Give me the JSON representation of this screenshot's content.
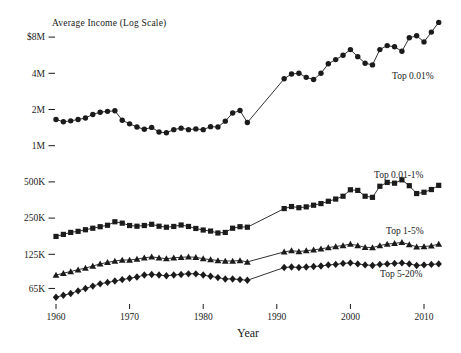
{
  "chart_data": {
    "type": "line",
    "title": "Average Income (Log Scale)",
    "xlabel": "Year",
    "scale": "log",
    "grid": false,
    "background": "#ffffff",
    "line_color": "#1b1b1b",
    "x_range": [
      1960,
      2012
    ],
    "x_ticks": [
      1960,
      1970,
      1980,
      1990,
      2000,
      2010
    ],
    "y_ticks": [
      {
        "label": "$8M",
        "value": 8000000
      },
      {
        "label": "4M",
        "value": 4000000
      },
      {
        "label": "2M",
        "value": 2000000
      },
      {
        "label": "1M",
        "value": 1000000
      },
      {
        "label": "500K",
        "value": 500000
      },
      {
        "label": "250K",
        "value": 250000
      },
      {
        "label": "125K",
        "value": 125000
      },
      {
        "label": "65K",
        "value": 65000
      }
    ],
    "data_gap_years": [
      1987,
      1988,
      1989,
      1990
    ],
    "series": [
      {
        "name": "Top 0.01%",
        "marker": "circle",
        "label_pos": {
          "x": 392,
          "y": 79
        },
        "points": [
          [
            1960,
            1650000
          ],
          [
            1961,
            1580000
          ],
          [
            1962,
            1610000
          ],
          [
            1963,
            1650000
          ],
          [
            1964,
            1700000
          ],
          [
            1965,
            1820000
          ],
          [
            1966,
            1900000
          ],
          [
            1967,
            1930000
          ],
          [
            1968,
            1950000
          ],
          [
            1969,
            1630000
          ],
          [
            1970,
            1520000
          ],
          [
            1971,
            1430000
          ],
          [
            1972,
            1370000
          ],
          [
            1973,
            1420000
          ],
          [
            1974,
            1300000
          ],
          [
            1975,
            1280000
          ],
          [
            1976,
            1360000
          ],
          [
            1977,
            1400000
          ],
          [
            1978,
            1360000
          ],
          [
            1979,
            1380000
          ],
          [
            1980,
            1360000
          ],
          [
            1981,
            1440000
          ],
          [
            1982,
            1430000
          ],
          [
            1983,
            1600000
          ],
          [
            1984,
            1870000
          ],
          [
            1985,
            1960000
          ],
          [
            1986,
            1560000
          ],
          [
            1991,
            3600000
          ],
          [
            1992,
            3950000
          ],
          [
            1993,
            4000000
          ],
          [
            1994,
            3700000
          ],
          [
            1995,
            3550000
          ],
          [
            1996,
            4000000
          ],
          [
            1997,
            4800000
          ],
          [
            1998,
            5200000
          ],
          [
            1999,
            5650000
          ],
          [
            2000,
            6300000
          ],
          [
            2001,
            5500000
          ],
          [
            2002,
            4850000
          ],
          [
            2003,
            4700000
          ],
          [
            2004,
            6300000
          ],
          [
            2005,
            6800000
          ],
          [
            2006,
            6650000
          ],
          [
            2007,
            6100000
          ],
          [
            2008,
            7900000
          ],
          [
            2009,
            8200000
          ],
          [
            2010,
            7300000
          ],
          [
            2011,
            8800000
          ],
          [
            2012,
            10600000
          ]
        ]
      },
      {
        "name": "Top 0.01-1%",
        "marker": "square",
        "label_pos": {
          "x": 374,
          "y": 178
        },
        "points": [
          [
            1960,
            176000
          ],
          [
            1961,
            183000
          ],
          [
            1962,
            190000
          ],
          [
            1963,
            194000
          ],
          [
            1964,
            200000
          ],
          [
            1965,
            206000
          ],
          [
            1966,
            212000
          ],
          [
            1967,
            218000
          ],
          [
            1968,
            233000
          ],
          [
            1969,
            227000
          ],
          [
            1970,
            217000
          ],
          [
            1971,
            214000
          ],
          [
            1972,
            217000
          ],
          [
            1973,
            222000
          ],
          [
            1974,
            214000
          ],
          [
            1975,
            210000
          ],
          [
            1976,
            213000
          ],
          [
            1977,
            219000
          ],
          [
            1978,
            213000
          ],
          [
            1979,
            205000
          ],
          [
            1980,
            199000
          ],
          [
            1981,
            195000
          ],
          [
            1982,
            188000
          ],
          [
            1983,
            190000
          ],
          [
            1984,
            206000
          ],
          [
            1985,
            212000
          ],
          [
            1986,
            210000
          ],
          [
            1991,
            300000
          ],
          [
            1992,
            312000
          ],
          [
            1993,
            305000
          ],
          [
            1994,
            310000
          ],
          [
            1995,
            320000
          ],
          [
            1996,
            330000
          ],
          [
            1997,
            345000
          ],
          [
            1998,
            360000
          ],
          [
            1999,
            380000
          ],
          [
            2000,
            430000
          ],
          [
            2001,
            425000
          ],
          [
            2002,
            380000
          ],
          [
            2003,
            372000
          ],
          [
            2004,
            460000
          ],
          [
            2005,
            495000
          ],
          [
            2006,
            488000
          ],
          [
            2007,
            520000
          ],
          [
            2008,
            465000
          ],
          [
            2009,
            400000
          ],
          [
            2010,
            410000
          ],
          [
            2011,
            432000
          ],
          [
            2012,
            468000
          ]
        ]
      },
      {
        "name": "Top 1-5%",
        "marker": "triangle",
        "label_pos": {
          "x": 386,
          "y": 234
        },
        "points": [
          [
            1960,
            84000
          ],
          [
            1961,
            87000
          ],
          [
            1962,
            90000
          ],
          [
            1963,
            93000
          ],
          [
            1964,
            96000
          ],
          [
            1965,
            100000
          ],
          [
            1966,
            104000
          ],
          [
            1967,
            107000
          ],
          [
            1968,
            110000
          ],
          [
            1969,
            112000
          ],
          [
            1970,
            112000
          ],
          [
            1971,
            114000
          ],
          [
            1972,
            117000
          ],
          [
            1973,
            119000
          ],
          [
            1974,
            117000
          ],
          [
            1975,
            115000
          ],
          [
            1976,
            117000
          ],
          [
            1977,
            118000
          ],
          [
            1978,
            119000
          ],
          [
            1979,
            118000
          ],
          [
            1980,
            115000
          ],
          [
            1981,
            113000
          ],
          [
            1982,
            111000
          ],
          [
            1983,
            110000
          ],
          [
            1984,
            110000
          ],
          [
            1985,
            111000
          ],
          [
            1986,
            108000
          ],
          [
            1991,
            131000
          ],
          [
            1992,
            134000
          ],
          [
            1993,
            132000
          ],
          [
            1994,
            134000
          ],
          [
            1995,
            136000
          ],
          [
            1996,
            139000
          ],
          [
            1997,
            142000
          ],
          [
            1998,
            145000
          ],
          [
            1999,
            148000
          ],
          [
            2000,
            152000
          ],
          [
            2001,
            148000
          ],
          [
            2002,
            143000
          ],
          [
            2003,
            142000
          ],
          [
            2004,
            148000
          ],
          [
            2005,
            152000
          ],
          [
            2006,
            154000
          ],
          [
            2007,
            157000
          ],
          [
            2008,
            151000
          ],
          [
            2009,
            144000
          ],
          [
            2010,
            145000
          ],
          [
            2011,
            147000
          ],
          [
            2012,
            152000
          ]
        ]
      },
      {
        "name": "Top 5-20%",
        "marker": "diamond",
        "label_pos": {
          "x": 380,
          "y": 277
        },
        "points": [
          [
            1960,
            55000
          ],
          [
            1961,
            57000
          ],
          [
            1962,
            59000
          ],
          [
            1963,
            62000
          ],
          [
            1964,
            65000
          ],
          [
            1965,
            68000
          ],
          [
            1966,
            71000
          ],
          [
            1967,
            73000
          ],
          [
            1968,
            75000
          ],
          [
            1969,
            77000
          ],
          [
            1970,
            79000
          ],
          [
            1971,
            81000
          ],
          [
            1972,
            84000
          ],
          [
            1973,
            85000
          ],
          [
            1974,
            84000
          ],
          [
            1975,
            83000
          ],
          [
            1976,
            84000
          ],
          [
            1977,
            85000
          ],
          [
            1978,
            86000
          ],
          [
            1979,
            86000
          ],
          [
            1980,
            84000
          ],
          [
            1981,
            82000
          ],
          [
            1982,
            80000
          ],
          [
            1983,
            78000
          ],
          [
            1984,
            78000
          ],
          [
            1985,
            77000
          ],
          [
            1986,
            76000
          ],
          [
            1991,
            97000
          ],
          [
            1992,
            98000
          ],
          [
            1993,
            97000
          ],
          [
            1994,
            98000
          ],
          [
            1995,
            99000
          ],
          [
            1996,
            100000
          ],
          [
            1997,
            102000
          ],
          [
            1998,
            103000
          ],
          [
            1999,
            105000
          ],
          [
            2000,
            106000
          ],
          [
            2001,
            104000
          ],
          [
            2002,
            102000
          ],
          [
            2003,
            101000
          ],
          [
            2004,
            103000
          ],
          [
            2005,
            104000
          ],
          [
            2006,
            105000
          ],
          [
            2007,
            106000
          ],
          [
            2008,
            104000
          ],
          [
            2009,
            101000
          ],
          [
            2010,
            102000
          ],
          [
            2011,
            103000
          ],
          [
            2012,
            104000
          ]
        ]
      }
    ]
  }
}
